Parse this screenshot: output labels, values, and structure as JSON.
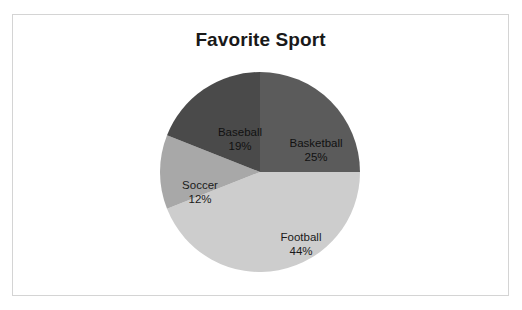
{
  "page": {
    "top_partial_text": "· · ·  ·   ·        ·      ·"
  },
  "chart_frame": {
    "border_color": "#d4d4d4",
    "background": "#ffffff"
  },
  "chart_data": {
    "type": "pie",
    "title": "Favorite Sport",
    "xlabel": "",
    "ylabel": "",
    "legend_position": "none",
    "labels_inside_slices": true,
    "start_angle_deg": 0,
    "direction": "clockwise",
    "categories": [
      "Basketball",
      "Football",
      "Soccer",
      "Baseball"
    ],
    "values": [
      25,
      44,
      12,
      19
    ],
    "value_suffix": "%",
    "total": 100,
    "slices": [
      {
        "name": "Basketball",
        "value": 25,
        "value_label": "25%",
        "color": "#5b5b5b",
        "start_deg": 0,
        "end_deg": 90
      },
      {
        "name": "Football",
        "value": 44,
        "value_label": "44%",
        "color": "#cdcdcd",
        "start_deg": 90,
        "end_deg": 248.4
      },
      {
        "name": "Soccer",
        "value": 12,
        "value_label": "12%",
        "color": "#a8a8a8",
        "start_deg": 248.4,
        "end_deg": 291.6
      },
      {
        "name": "Baseball",
        "value": 19,
        "value_label": "19%",
        "color": "#4a4a4a",
        "start_deg": 291.6,
        "end_deg": 360
      }
    ]
  }
}
